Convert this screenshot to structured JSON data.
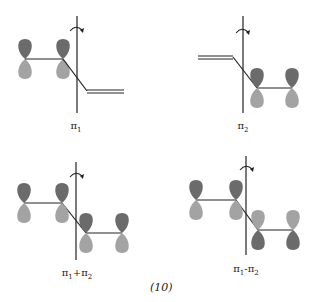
{
  "figure": {
    "equation_number": "(10)",
    "colors": {
      "dark_lobe": "#6b6b6b",
      "light_lobe": "#a3a3a3",
      "line": "#222222"
    },
    "panels": [
      {
        "id": "pi1",
        "label": "π",
        "subscript": "1",
        "label_suffix": ""
      },
      {
        "id": "pi2",
        "label": "π",
        "subscript": "2",
        "label_suffix": ""
      },
      {
        "id": "pi1_plus_pi2",
        "label": "π",
        "subscript": "1",
        "operator": "+",
        "label2": "π",
        "subscript2": "2"
      },
      {
        "id": "pi1_minus_pi2",
        "label": "π",
        "subscript": "1",
        "operator": "-",
        "label2": "π",
        "subscript2": "2"
      }
    ]
  }
}
